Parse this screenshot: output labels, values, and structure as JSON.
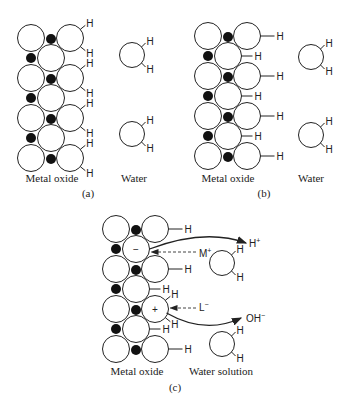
{
  "panels": [
    {
      "id": "a",
      "caption": "(a)",
      "left_label": "Metal oxide",
      "right_label": "Water",
      "surface": "hydroxylated-dissociative"
    },
    {
      "id": "b",
      "caption": "(b)",
      "left_label": "Metal oxide",
      "right_label": "Water",
      "surface": "hydroxyl-terminated"
    },
    {
      "id": "c",
      "caption": "(c)",
      "left_label": "Metal oxide",
      "right_label": "Water solution",
      "surface": "charged"
    }
  ],
  "atom_label": "H",
  "charges": {
    "negative": "−",
    "positive": "+"
  },
  "ions": {
    "proton": "H",
    "proton_sup": "+",
    "metal_cation": "M",
    "metal_cation_sup": "+",
    "ligand_anion": "L",
    "ligand_anion_sup": "−",
    "hydroxide": "OH",
    "hydroxide_sup": "−"
  },
  "colors": {
    "stroke": "#222222",
    "metal": "#111111",
    "oxygen_fill": "#ffffff"
  }
}
